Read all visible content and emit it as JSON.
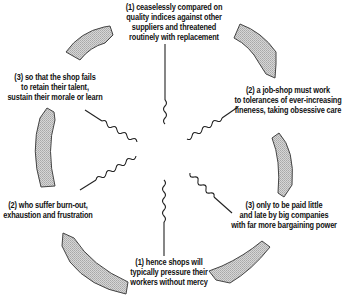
{
  "diagram": {
    "type": "cycle",
    "direction": "clockwise",
    "colors": {
      "arrow_fill": "#c8c8c8",
      "arrow_stroke": "#444444",
      "connector": "#222222",
      "text": "#111111"
    },
    "nodes": [
      {
        "id": "top",
        "lines": [
          "(1) ceaselessly compared on",
          "quality indices against other",
          "suppliers and threatened",
          "routinely with replacement"
        ]
      },
      {
        "id": "right-upper",
        "lines": [
          "(2) a job-shop must work",
          "to tolerances of ever-increasing",
          "fineness, taking obsessive care"
        ]
      },
      {
        "id": "right-lower",
        "lines": [
          "(3) only to be paid little",
          "and late by big companies",
          "with far more bargaining power"
        ]
      },
      {
        "id": "bottom",
        "lines": [
          "(1) hence shops will",
          "typically pressure their",
          "workers without mercy"
        ]
      },
      {
        "id": "left-lower",
        "lines": [
          "(2) who suffer burn-out,",
          "exhaustion and frustration"
        ]
      },
      {
        "id": "left-upper",
        "lines": [
          "(3) so that the shop fails",
          "to retain their talent,",
          "sustain their morale or learn"
        ]
      }
    ],
    "arrows": [
      {
        "from": "left-upper",
        "to": "top"
      },
      {
        "from": "top",
        "to": "right-upper"
      },
      {
        "from": "right-upper",
        "to": "right-lower"
      },
      {
        "from": "right-lower",
        "to": "bottom"
      },
      {
        "from": "bottom",
        "to": "left-lower"
      },
      {
        "from": "left-lower",
        "to": "left-upper"
      }
    ]
  }
}
